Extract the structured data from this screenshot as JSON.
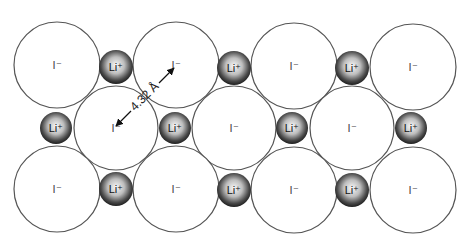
{
  "colors": {
    "background": "#ffffff",
    "anion_fill": "#ffffff",
    "anion_stroke": "#555555",
    "cation_dark": "#2a2a2a",
    "cation_light": "#f4f4f4",
    "arrow": "#111111"
  },
  "labels": {
    "anion": "I⁻",
    "cation": "Li⁺",
    "distance": "4.32 Å"
  },
  "anions": [
    {
      "x": 57,
      "y": 65,
      "r": 43
    },
    {
      "x": 176,
      "y": 65,
      "r": 43
    },
    {
      "x": 294,
      "y": 66,
      "r": 43
    },
    {
      "x": 413,
      "y": 67,
      "r": 43
    },
    {
      "x": 116,
      "y": 128,
      "r": 42
    },
    {
      "x": 234,
      "y": 128,
      "r": 42
    },
    {
      "x": 352,
      "y": 128,
      "r": 42
    },
    {
      "x": 57,
      "y": 189,
      "r": 43
    },
    {
      "x": 176,
      "y": 189,
      "r": 43
    },
    {
      "x": 294,
      "y": 190,
      "r": 43
    },
    {
      "x": 413,
      "y": 190,
      "r": 43
    }
  ],
  "cations": [
    {
      "x": 116,
      "y": 67,
      "r": 17
    },
    {
      "x": 234,
      "y": 68,
      "r": 17
    },
    {
      "x": 352,
      "y": 68,
      "r": 17
    },
    {
      "x": 56,
      "y": 128,
      "r": 16
    },
    {
      "x": 175,
      "y": 128,
      "r": 16
    },
    {
      "x": 292,
      "y": 128,
      "r": 16
    },
    {
      "x": 411,
      "y": 128,
      "r": 16
    },
    {
      "x": 116,
      "y": 189,
      "r": 17
    },
    {
      "x": 234,
      "y": 190,
      "r": 17
    },
    {
      "x": 352,
      "y": 190,
      "r": 17
    }
  ],
  "distance_marker": {
    "from": {
      "x": 116,
      "y": 126
    },
    "to": {
      "x": 174,
      "y": 68
    },
    "label_x": 145,
    "label_y": 97,
    "angle": -45
  }
}
